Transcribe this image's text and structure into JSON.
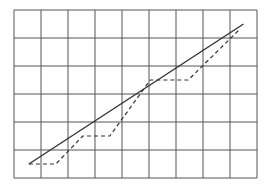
{
  "chart_data": {
    "type": "line",
    "title": "",
    "xlabel": "",
    "ylabel": "",
    "grid": true,
    "grid_columns": 9,
    "grid_rows": 6,
    "legend": null,
    "xlim": [
      0,
      9
    ],
    "ylim": [
      0,
      6
    ],
    "series": [
      {
        "name": "solid-line",
        "style": "solid",
        "color": "#333333",
        "x": [
          0.55,
          8.5
        ],
        "y": [
          0.5,
          5.5
        ]
      },
      {
        "name": "dashed-step-line",
        "style": "dashed",
        "color": "#333333",
        "x": [
          0.55,
          1.55,
          2.55,
          3.55,
          5.05,
          6.45,
          8.35
        ],
        "y": [
          0.5,
          0.5,
          1.5,
          1.5,
          3.5,
          3.5,
          5.3
        ]
      }
    ]
  },
  "colors": {
    "grid": "#555555",
    "background": "#ffffff",
    "line": "#333333"
  }
}
